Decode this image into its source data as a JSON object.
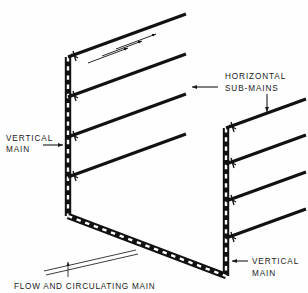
{
  "figure": {
    "kind": "piping-isometric-diagram",
    "background_color": "#fefefe",
    "ink_color": "#111111"
  },
  "labels": {
    "vertical_main_left": {
      "line1": "VERTICAL",
      "line2": "MAIN"
    },
    "horizontal_sub_mains": {
      "line1": "HORIZONTAL",
      "line2": "SUB-MAINS"
    },
    "vertical_main_right": {
      "line1": "VERTICAL",
      "line2": "MAIN"
    },
    "flow_and_circulating_main": "FLOW AND CIRCULATING MAIN"
  },
  "geometry": {
    "left_panel": {
      "vertical_main": {
        "x": 68,
        "y_top": 57,
        "y_bottom": 216
      },
      "sub_mains": [
        {
          "x1": 68,
          "y1": 57,
          "x2": 186,
          "y2": 14
        },
        {
          "x1": 68,
          "y1": 97,
          "x2": 186,
          "y2": 54
        },
        {
          "x1": 68,
          "y1": 137,
          "x2": 186,
          "y2": 94
        },
        {
          "x1": 68,
          "y1": 177,
          "x2": 186,
          "y2": 134
        }
      ],
      "flow_arrows": [
        {
          "x1": 88,
          "y1": 63,
          "x2": 128,
          "y2": 48
        },
        {
          "x1": 102,
          "y1": 56,
          "x2": 142,
          "y2": 41
        },
        {
          "x1": 116,
          "y1": 49,
          "x2": 156,
          "y2": 34
        }
      ]
    },
    "right_panel": {
      "vertical_main": {
        "x": 226,
        "y_top": 128,
        "y_bottom": 276
      },
      "sub_mains": [
        {
          "x1": 226,
          "y1": 128,
          "x2": 306,
          "y2": 99
        },
        {
          "x1": 226,
          "y1": 164,
          "x2": 306,
          "y2": 135
        },
        {
          "x1": 226,
          "y1": 201,
          "x2": 306,
          "y2": 172
        },
        {
          "x1": 226,
          "y1": 238,
          "x2": 306,
          "y2": 209
        }
      ]
    },
    "flow_circulating_main": {
      "x1": 68,
      "y1": 216,
      "x2": 226,
      "y2": 276
    }
  }
}
